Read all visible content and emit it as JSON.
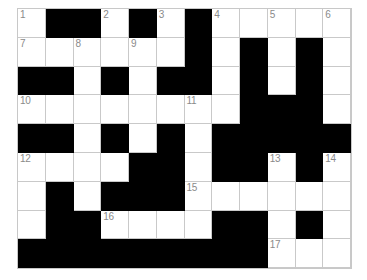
{
  "puzzle": {
    "title": "Crossword Grid",
    "columns": 12,
    "rows": 9,
    "colors": {
      "block": "#000000",
      "cell": "#ffffff",
      "grid_line": "#c9c9c9",
      "number_text": "#8a8a8a",
      "background": "#ffffff"
    },
    "clue_numbers": [
      1,
      2,
      3,
      4,
      5,
      6,
      7,
      8,
      9,
      10,
      11,
      12,
      13,
      14,
      15,
      16,
      17
    ],
    "grid": [
      [
        {
          "type": "white",
          "number": "1",
          "letter": ""
        },
        {
          "type": "black",
          "number": "",
          "letter": ""
        },
        {
          "type": "black",
          "number": "",
          "letter": ""
        },
        {
          "type": "white",
          "number": "2",
          "letter": ""
        },
        {
          "type": "black",
          "number": "",
          "letter": ""
        },
        {
          "type": "white",
          "number": "3",
          "letter": ""
        },
        {
          "type": "black",
          "number": "",
          "letter": ""
        },
        {
          "type": "white",
          "number": "4",
          "letter": ""
        },
        {
          "type": "white",
          "number": "",
          "letter": ""
        },
        {
          "type": "white",
          "number": "5",
          "letter": ""
        },
        {
          "type": "white",
          "number": "",
          "letter": ""
        },
        {
          "type": "white",
          "number": "6",
          "letter": ""
        }
      ],
      [
        {
          "type": "white",
          "number": "7",
          "letter": ""
        },
        {
          "type": "white",
          "number": "",
          "letter": ""
        },
        {
          "type": "white",
          "number": "8",
          "letter": ""
        },
        {
          "type": "white",
          "number": "",
          "letter": ""
        },
        {
          "type": "white",
          "number": "9",
          "letter": ""
        },
        {
          "type": "white",
          "number": "",
          "letter": ""
        },
        {
          "type": "black",
          "number": "",
          "letter": ""
        },
        {
          "type": "white",
          "number": "",
          "letter": ""
        },
        {
          "type": "black",
          "number": "",
          "letter": ""
        },
        {
          "type": "white",
          "number": "",
          "letter": ""
        },
        {
          "type": "black",
          "number": "",
          "letter": ""
        },
        {
          "type": "white",
          "number": "",
          "letter": ""
        }
      ],
      [
        {
          "type": "black",
          "number": "",
          "letter": ""
        },
        {
          "type": "black",
          "number": "",
          "letter": ""
        },
        {
          "type": "white",
          "number": "",
          "letter": ""
        },
        {
          "type": "black",
          "number": "",
          "letter": ""
        },
        {
          "type": "white",
          "number": "",
          "letter": ""
        },
        {
          "type": "black",
          "number": "",
          "letter": ""
        },
        {
          "type": "black",
          "number": "",
          "letter": ""
        },
        {
          "type": "white",
          "number": "",
          "letter": ""
        },
        {
          "type": "black",
          "number": "",
          "letter": ""
        },
        {
          "type": "white",
          "number": "",
          "letter": ""
        },
        {
          "type": "black",
          "number": "",
          "letter": ""
        },
        {
          "type": "white",
          "number": "",
          "letter": ""
        }
      ],
      [
        {
          "type": "white",
          "number": "10",
          "letter": ""
        },
        {
          "type": "white",
          "number": "",
          "letter": ""
        },
        {
          "type": "white",
          "number": "",
          "letter": ""
        },
        {
          "type": "white",
          "number": "",
          "letter": ""
        },
        {
          "type": "white",
          "number": "",
          "letter": ""
        },
        {
          "type": "white",
          "number": "",
          "letter": ""
        },
        {
          "type": "white",
          "number": "11",
          "letter": ""
        },
        {
          "type": "white",
          "number": "",
          "letter": ""
        },
        {
          "type": "black",
          "number": "",
          "letter": ""
        },
        {
          "type": "black",
          "number": "",
          "letter": ""
        },
        {
          "type": "black",
          "number": "",
          "letter": ""
        },
        {
          "type": "white",
          "number": "",
          "letter": ""
        }
      ],
      [
        {
          "type": "black",
          "number": "",
          "letter": ""
        },
        {
          "type": "black",
          "number": "",
          "letter": ""
        },
        {
          "type": "white",
          "number": "",
          "letter": ""
        },
        {
          "type": "black",
          "number": "",
          "letter": ""
        },
        {
          "type": "white",
          "number": "",
          "letter": ""
        },
        {
          "type": "black",
          "number": "",
          "letter": ""
        },
        {
          "type": "white",
          "number": "",
          "letter": ""
        },
        {
          "type": "black",
          "number": "",
          "letter": ""
        },
        {
          "type": "black",
          "number": "",
          "letter": ""
        },
        {
          "type": "black",
          "number": "",
          "letter": ""
        },
        {
          "type": "black",
          "number": "",
          "letter": ""
        },
        {
          "type": "black",
          "number": "",
          "letter": ""
        }
      ],
      [
        {
          "type": "white",
          "number": "12",
          "letter": ""
        },
        {
          "type": "white",
          "number": "",
          "letter": ""
        },
        {
          "type": "white",
          "number": "",
          "letter": ""
        },
        {
          "type": "white",
          "number": "",
          "letter": ""
        },
        {
          "type": "black",
          "number": "",
          "letter": ""
        },
        {
          "type": "black",
          "number": "",
          "letter": ""
        },
        {
          "type": "white",
          "number": "",
          "letter": ""
        },
        {
          "type": "black",
          "number": "",
          "letter": ""
        },
        {
          "type": "black",
          "number": "",
          "letter": ""
        },
        {
          "type": "white",
          "number": "13",
          "letter": ""
        },
        {
          "type": "black",
          "number": "",
          "letter": ""
        },
        {
          "type": "white",
          "number": "14",
          "letter": ""
        }
      ],
      [
        {
          "type": "white",
          "number": "",
          "letter": ""
        },
        {
          "type": "black",
          "number": "",
          "letter": ""
        },
        {
          "type": "white",
          "number": "",
          "letter": ""
        },
        {
          "type": "black",
          "number": "",
          "letter": ""
        },
        {
          "type": "black",
          "number": "",
          "letter": ""
        },
        {
          "type": "black",
          "number": "",
          "letter": ""
        },
        {
          "type": "white",
          "number": "15",
          "letter": ""
        },
        {
          "type": "white",
          "number": "",
          "letter": ""
        },
        {
          "type": "white",
          "number": "",
          "letter": ""
        },
        {
          "type": "white",
          "number": "",
          "letter": ""
        },
        {
          "type": "white",
          "number": "",
          "letter": ""
        },
        {
          "type": "white",
          "number": "",
          "letter": ""
        }
      ],
      [
        {
          "type": "white",
          "number": "",
          "letter": ""
        },
        {
          "type": "black",
          "number": "",
          "letter": ""
        },
        {
          "type": "black",
          "number": "",
          "letter": ""
        },
        {
          "type": "white",
          "number": "16",
          "letter": ""
        },
        {
          "type": "white",
          "number": "",
          "letter": ""
        },
        {
          "type": "white",
          "number": "",
          "letter": ""
        },
        {
          "type": "white",
          "number": "",
          "letter": ""
        },
        {
          "type": "black",
          "number": "",
          "letter": ""
        },
        {
          "type": "black",
          "number": "",
          "letter": ""
        },
        {
          "type": "white",
          "number": "",
          "letter": ""
        },
        {
          "type": "black",
          "number": "",
          "letter": ""
        },
        {
          "type": "white",
          "number": "",
          "letter": ""
        }
      ],
      [
        {
          "type": "black",
          "number": "",
          "letter": ""
        },
        {
          "type": "black",
          "number": "",
          "letter": ""
        },
        {
          "type": "black",
          "number": "",
          "letter": ""
        },
        {
          "type": "black",
          "number": "",
          "letter": ""
        },
        {
          "type": "black",
          "number": "",
          "letter": ""
        },
        {
          "type": "black",
          "number": "",
          "letter": ""
        },
        {
          "type": "black",
          "number": "",
          "letter": ""
        },
        {
          "type": "black",
          "number": "",
          "letter": ""
        },
        {
          "type": "black",
          "number": "",
          "letter": ""
        },
        {
          "type": "white",
          "number": "17",
          "letter": ""
        },
        {
          "type": "white",
          "number": "",
          "letter": ""
        },
        {
          "type": "white",
          "number": "",
          "letter": ""
        }
      ]
    ]
  }
}
